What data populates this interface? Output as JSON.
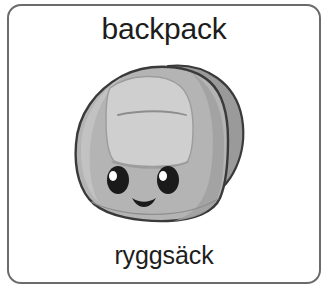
{
  "card": {
    "word_english": "backpack",
    "word_swedish": "ryggsäck",
    "border_color": "#6b6b6b",
    "background_color": "#ffffff",
    "text_color": "#1d1d1d"
  },
  "illustration": {
    "name": "backpack-illustration",
    "style": "kawaii cartoon backpack with smiling face",
    "colors": {
      "outline": "#3a3a3a",
      "body_light": "#c8c8c8",
      "body_mid": "#b4b4b4",
      "body_shadow": "#a0a0a0",
      "strap": "#9a9a9a",
      "pocket": "#cfcfcf",
      "eye": "#1a1a1a",
      "eye_highlight": "#ffffff",
      "gap": "#ffffff"
    },
    "face": {
      "left_eye": "oval-eye-with-highlight",
      "right_eye": "oval-eye-with-highlight",
      "mouth": "smile-arc"
    }
  }
}
